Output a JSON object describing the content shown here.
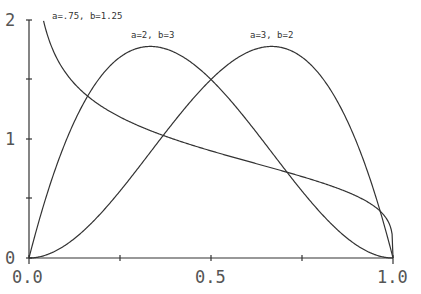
{
  "chart_data": {
    "type": "line",
    "title": "",
    "xlabel": "",
    "ylabel": "",
    "xlim": [
      0,
      1
    ],
    "ylim": [
      0,
      2
    ],
    "grid": false,
    "x_ticks": [
      "0.0",
      "0.5",
      "1.0"
    ],
    "x_minor_ticks": [
      0.25,
      0.75
    ],
    "y_ticks": [
      "0",
      "1",
      "2"
    ],
    "y_minor_ticks": [
      0.5,
      1.5
    ],
    "series": [
      {
        "name": "a=.75, b=1.25",
        "a": 0.75,
        "b": 1.25,
        "x": [
          0.03,
          0.05,
          0.1,
          0.2,
          0.3,
          0.4,
          0.5,
          0.6,
          0.7,
          0.8,
          0.9,
          0.95,
          0.99
        ],
        "values": [
          1.95,
          1.73,
          1.44,
          1.14,
          0.98,
          0.87,
          0.9,
          0.73,
          0.68,
          0.6,
          0.5,
          0.43,
          0.31
        ]
      },
      {
        "name": "a=2, b=3",
        "a": 2,
        "b": 3,
        "x": [
          0,
          0.1,
          0.2,
          0.3,
          0.333,
          0.4,
          0.5,
          0.6,
          0.7,
          0.8,
          0.9,
          1.0
        ],
        "values": [
          0,
          0.97,
          1.54,
          1.76,
          1.78,
          1.73,
          1.5,
          1.15,
          0.76,
          0.38,
          0.11,
          0
        ]
      },
      {
        "name": "a=3, b=2",
        "a": 3,
        "b": 2,
        "x": [
          0,
          0.1,
          0.2,
          0.3,
          0.4,
          0.5,
          0.6,
          0.667,
          0.7,
          0.8,
          0.9,
          1.0
        ],
        "values": [
          0,
          0.11,
          0.38,
          0.76,
          1.15,
          1.5,
          1.73,
          1.78,
          1.76,
          1.54,
          0.97,
          0
        ]
      }
    ],
    "annotations": [
      {
        "text": "a=.75, b=1.25",
        "x": 0.06,
        "y": 2.0
      },
      {
        "text": "a=2, b=3",
        "x": 0.29,
        "y": 1.9
      },
      {
        "text": "a=3, b=2",
        "x": 0.61,
        "y": 1.9
      }
    ]
  },
  "labels": {
    "x0": "0.0",
    "x1": "0.5",
    "x2": "1.0",
    "y0": "0",
    "y1": "1",
    "y2": "2",
    "curve1": "a=.75, b=1.25",
    "curve2": "a=2, b=3",
    "curve3": "a=3, b=2"
  }
}
